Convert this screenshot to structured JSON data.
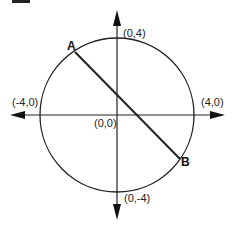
{
  "diagram": {
    "type": "circle-on-coordinate-axes",
    "circle": {
      "center": [
        0,
        0
      ],
      "radius": 4
    },
    "axis_labels": {
      "top": "(0,4)",
      "bottom": "(0,-4)",
      "left": "(-4,0)",
      "right": "(4,0)",
      "origin": "(0,0)"
    },
    "points": [
      {
        "name": "A"
      },
      {
        "name": "B"
      }
    ],
    "segment": "AB",
    "colors": {
      "stroke": "#222222",
      "background": "#ffffff"
    }
  }
}
